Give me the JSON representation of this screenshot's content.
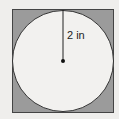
{
  "diagram": {
    "type": "circle-inscribed-in-square",
    "radius_label": "2 in",
    "colors": {
      "background": "#efeeec",
      "square_fill": "#9b9b9b",
      "circle_fill": "#f2f1ef",
      "stroke": "#333333"
    }
  }
}
